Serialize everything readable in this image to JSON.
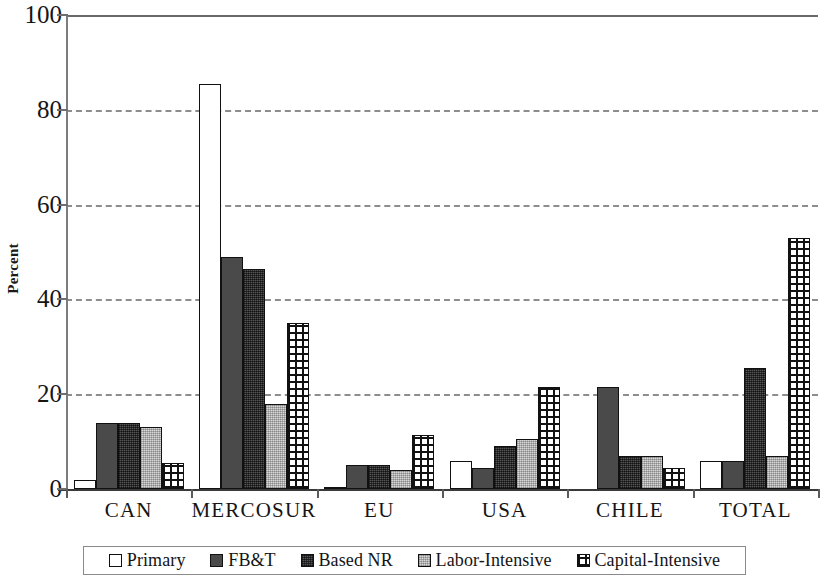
{
  "chart_data": {
    "type": "bar",
    "title": "",
    "subtitle": "",
    "xlabel": "",
    "ylabel": "Percent",
    "ylim": [
      0,
      100
    ],
    "yticks": [
      0,
      20,
      40,
      60,
      80,
      100
    ],
    "ytick_labels": [
      "0",
      "20",
      "40",
      "60",
      "80",
      "100"
    ],
    "grid": true,
    "grid_axis": "y",
    "grid_style": "dashed",
    "legend_position": "bottom",
    "categories": [
      "CAN",
      "MERCOSUR",
      "EU",
      "USA",
      "CHILE",
      "TOTAL"
    ],
    "series": [
      {
        "name": "Primary",
        "pattern": "open-white",
        "values": [
          2.0,
          85.5,
          0.5,
          6.0,
          0.0,
          6.0
        ]
      },
      {
        "name": "FB&T",
        "pattern": "solid-dark-gray",
        "values": [
          14.0,
          49.0,
          5.0,
          4.5,
          21.5,
          6.0
        ]
      },
      {
        "name": "Based NR",
        "pattern": "dense-dark-stipple",
        "values": [
          14.0,
          46.5,
          5.0,
          9.0,
          7.0,
          25.5
        ]
      },
      {
        "name": "Labor-Intensive",
        "pattern": "light-gray-stipple",
        "values": [
          13.0,
          18.0,
          4.0,
          10.5,
          7.0,
          7.0
        ]
      },
      {
        "name": "Capital-Intensive",
        "pattern": "checkerboard-grid",
        "values": [
          5.5,
          35.0,
          11.5,
          21.5,
          4.5,
          53.0
        ]
      }
    ]
  },
  "legend": {
    "items": [
      {
        "label": "Primary",
        "swatch": "swatch-open-white"
      },
      {
        "label": "FB&T",
        "swatch": "swatch-solid-dark"
      },
      {
        "label": "Based NR",
        "swatch": "swatch-stipple-dark"
      },
      {
        "label": "Labor-Intensive",
        "swatch": "swatch-stipple-light"
      },
      {
        "label": "Capital-Intensive",
        "swatch": "swatch-checkerboard"
      }
    ]
  },
  "colors": {
    "primary": "#ffffff",
    "fbt": "#4a4a4a",
    "based_nr": "#555555",
    "labor": "#d8d8d8",
    "capital": "#ffffff",
    "outline": "#111111",
    "gridline": "#8d8d8d",
    "axis": "#3a3a3a"
  }
}
